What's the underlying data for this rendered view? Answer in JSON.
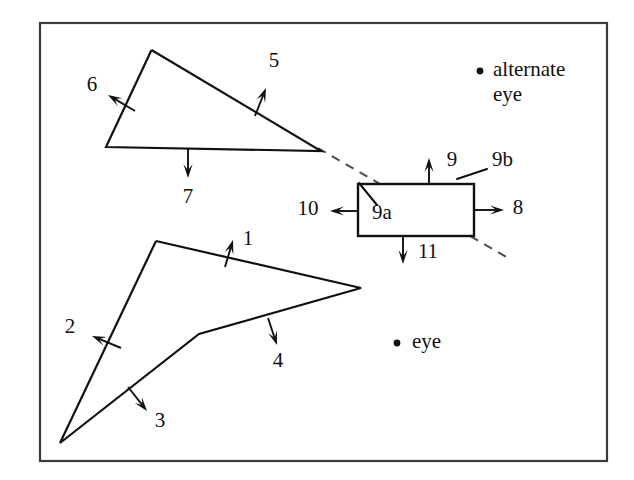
{
  "figure": {
    "background_color": "#ffffff",
    "ink_color": "#111111",
    "frame_color": "#3a3a3a",
    "dash_color": "#4d4d4d"
  },
  "frame": {
    "x": 40,
    "y": 23,
    "width": 567,
    "height": 438
  },
  "shapes": {
    "upper_triangle": {
      "name": "upper-triangle",
      "points": "151.5,50 321,151 106,147 151.5,50",
      "vertices": [
        [
          151.5,
          50
        ],
        [
          321,
          151
        ],
        [
          106,
          147
        ]
      ]
    },
    "lower_polygon": {
      "name": "lower-polygon",
      "points": "156,241 361,288 199,334 60,443 156,241",
      "vertices": [
        [
          156,
          241
        ],
        [
          361,
          288
        ],
        [
          199,
          334
        ],
        [
          60,
          443
        ]
      ]
    },
    "rectangle": {
      "name": "center-rectangle",
      "x": 358,
      "y": 184,
      "width": 116,
      "height": 52
    }
  },
  "sight_line": {
    "name": "alternate-eye-sight-line",
    "from": [
      318,
      148
    ],
    "to": [
      508,
      258
    ],
    "style": "dashed"
  },
  "leaders": [
    {
      "name": "leader-9a",
      "from": [
        359,
        183
      ],
      "to": [
        377,
        205
      ]
    },
    {
      "name": "leader-9b",
      "from": [
        457,
        179
      ],
      "to": [
        487,
        169
      ]
    }
  ],
  "edge_normals": [
    {
      "id": "1",
      "label": "1",
      "name": "edge-normal-1",
      "tail": [
        225,
        267
      ],
      "head": [
        233,
        240
      ],
      "label_pos": [
        248,
        240
      ]
    },
    {
      "id": "2",
      "label": "2",
      "name": "edge-normal-2",
      "tail": [
        121,
        348
      ],
      "head": [
        92,
        336
      ],
      "label_pos": [
        70,
        328
      ]
    },
    {
      "id": "3",
      "label": "3",
      "name": "edge-normal-3",
      "tail": [
        128,
        387
      ],
      "head": [
        147,
        411
      ],
      "label_pos": [
        160,
        422
      ]
    },
    {
      "id": "4",
      "label": "4",
      "name": "edge-normal-4",
      "tail": [
        268,
        318
      ],
      "head": [
        277,
        345
      ],
      "label_pos": [
        278,
        362
      ]
    },
    {
      "id": "5",
      "label": "5",
      "name": "edge-normal-5",
      "tail": [
        255,
        116
      ],
      "head": [
        266,
        88
      ],
      "label_pos": [
        274,
        62
      ]
    },
    {
      "id": "6",
      "label": "6",
      "name": "edge-normal-6",
      "tail": [
        135,
        111
      ],
      "head": [
        108,
        95
      ],
      "label_pos": [
        92,
        86
      ]
    },
    {
      "id": "7",
      "label": "7",
      "name": "edge-normal-7",
      "tail": [
        188,
        148
      ],
      "head": [
        188,
        178
      ],
      "label_pos": [
        188,
        198
      ]
    },
    {
      "id": "8",
      "label": "8",
      "name": "edge-normal-8",
      "tail": [
        474,
        210
      ],
      "head": [
        504,
        210
      ],
      "label_pos": [
        518,
        209
      ]
    },
    {
      "id": "9",
      "label": "9",
      "name": "edge-normal-9",
      "tail": [
        429,
        184
      ],
      "head": [
        429,
        158
      ],
      "label_pos": [
        452,
        161
      ]
    },
    {
      "id": "10",
      "label": "10",
      "name": "edge-normal-10",
      "tail": [
        358,
        211
      ],
      "head": [
        330,
        211
      ],
      "label_pos": [
        308,
        210
      ]
    },
    {
      "id": "11",
      "label": "11",
      "name": "edge-normal-11",
      "tail": [
        403,
        236
      ],
      "head": [
        403,
        264
      ],
      "label_pos": [
        428,
        253
      ]
    }
  ],
  "inline_labels": [
    {
      "id": "9a",
      "label": "9a",
      "name": "label-9a",
      "pos": [
        372,
        214
      ]
    },
    {
      "id": "9b",
      "label": "9b",
      "name": "label-9b",
      "pos": [
        492,
        161
      ]
    }
  ],
  "eyes": [
    {
      "name": "alternate-eye",
      "label_line1": "alternate",
      "label_line2": "eye",
      "dot": [
        480,
        71
      ],
      "text_pos": [
        493,
        71
      ],
      "text_pos2": [
        493,
        96
      ]
    },
    {
      "name": "eye",
      "label_line1": "eye",
      "label_line2": "",
      "dot": [
        397,
        343
      ],
      "text_pos": [
        412,
        343
      ],
      "text_pos2": null
    }
  ]
}
